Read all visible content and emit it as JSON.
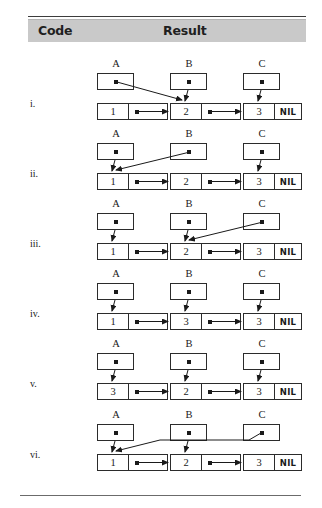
{
  "page": {
    "width": 322,
    "height": 508,
    "background": "#ffffff",
    "ink_color": "#1a1a1a"
  },
  "header": {
    "columns": [
      {
        "label": "Code",
        "name": "column-header-code"
      },
      {
        "label": "Result",
        "name": "column-header-result"
      }
    ],
    "background": "#c9c9c9",
    "rule_color": "#3c3c3c"
  },
  "pointer_labels": [
    "A",
    "B",
    "C"
  ],
  "nil_label": "NIL",
  "rows": [
    {
      "label": "i.",
      "nodes": [
        {
          "value": "1",
          "has_next": true
        },
        {
          "value": "2",
          "has_next": true
        },
        {
          "value": "3",
          "has_next": false,
          "nil": "NIL"
        }
      ],
      "pointers": [
        {
          "name": "A",
          "target_node": 1,
          "arrow": "diagonal-right-down"
        },
        {
          "name": "B",
          "target_node": 1,
          "arrow": "straight-down"
        },
        {
          "name": "C",
          "target_node": 2,
          "arrow": "straight-down"
        }
      ]
    },
    {
      "label": "ii.",
      "nodes": [
        {
          "value": "1",
          "has_next": true
        },
        {
          "value": "2",
          "has_next": true
        },
        {
          "value": "3",
          "has_next": false,
          "nil": "NIL"
        }
      ],
      "pointers": [
        {
          "name": "A",
          "target_node": 0,
          "arrow": "straight-down"
        },
        {
          "name": "B",
          "target_node": 0,
          "arrow": "diagonal-left-down"
        },
        {
          "name": "C",
          "target_node": 2,
          "arrow": "straight-down"
        }
      ]
    },
    {
      "label": "iii.",
      "nodes": [
        {
          "value": "1",
          "has_next": true
        },
        {
          "value": "2",
          "has_next": true
        },
        {
          "value": "3",
          "has_next": false,
          "nil": "NIL"
        }
      ],
      "pointers": [
        {
          "name": "A",
          "target_node": 0,
          "arrow": "straight-down"
        },
        {
          "name": "B",
          "target_node": 1,
          "arrow": "straight-down"
        },
        {
          "name": "C",
          "target_node": 1,
          "arrow": "diagonal-left-down"
        }
      ]
    },
    {
      "label": "iv.",
      "nodes": [
        {
          "value": "1",
          "has_next": true
        },
        {
          "value": "3",
          "has_next": true
        },
        {
          "value": "3",
          "has_next": false,
          "nil": "NIL"
        }
      ],
      "pointers": [
        {
          "name": "A",
          "target_node": 0,
          "arrow": "straight-down"
        },
        {
          "name": "B",
          "target_node": 1,
          "arrow": "straight-down"
        },
        {
          "name": "C",
          "target_node": 2,
          "arrow": "straight-down"
        }
      ]
    },
    {
      "label": "v.",
      "nodes": [
        {
          "value": "3",
          "has_next": true
        },
        {
          "value": "2",
          "has_next": true
        },
        {
          "value": "3",
          "has_next": false,
          "nil": "NIL"
        }
      ],
      "pointers": [
        {
          "name": "A",
          "target_node": 0,
          "arrow": "straight-down"
        },
        {
          "name": "B",
          "target_node": 1,
          "arrow": "straight-down"
        },
        {
          "name": "C",
          "target_node": 2,
          "arrow": "straight-down"
        }
      ]
    },
    {
      "label": "vi.",
      "nodes": [
        {
          "value": "1",
          "has_next": true
        },
        {
          "value": "2",
          "has_next": true
        },
        {
          "value": "3",
          "has_next": false,
          "nil": "NIL"
        }
      ],
      "pointers": [
        {
          "name": "A",
          "target_node": 0,
          "arrow": "straight-down"
        },
        {
          "name": "B",
          "target_node": 1,
          "arrow": "straight-down"
        },
        {
          "name": "C",
          "target_node": 0,
          "arrow": "polyline-left-down"
        }
      ]
    }
  ]
}
